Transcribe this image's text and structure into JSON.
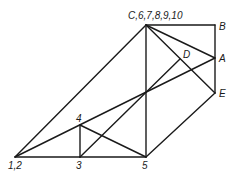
{
  "diagram": {
    "nodes": [
      {
        "id": "C",
        "label": "C,6,7,8,9,10",
        "x": 146,
        "y": 25,
        "lx": 128,
        "ly": 19
      },
      {
        "id": "B",
        "label": "B",
        "x": 215,
        "y": 25,
        "lx": 219,
        "ly": 30
      },
      {
        "id": "A",
        "label": "A",
        "x": 215,
        "y": 58,
        "lx": 219,
        "ly": 62
      },
      {
        "id": "D",
        "label": "D",
        "x": 180,
        "y": 59,
        "lx": 183,
        "ly": 58
      },
      {
        "id": "E",
        "label": "E",
        "x": 215,
        "y": 93,
        "lx": 219,
        "ly": 97
      },
      {
        "id": "X",
        "label": "",
        "x": 146,
        "y": 93,
        "lx": 0,
        "ly": 0
      },
      {
        "id": "4",
        "label": "4",
        "x": 80,
        "y": 125,
        "lx": 76,
        "ly": 122
      },
      {
        "id": "12",
        "label": "1,2",
        "x": 15,
        "y": 157,
        "lx": 8,
        "ly": 169
      },
      {
        "id": "3",
        "label": "3",
        "x": 80,
        "y": 157,
        "lx": 76,
        "ly": 169
      },
      {
        "id": "5",
        "label": "5",
        "x": 146,
        "y": 157,
        "lx": 142,
        "ly": 169
      }
    ],
    "edges": [
      [
        "C",
        "B"
      ],
      [
        "B",
        "E"
      ],
      [
        "C",
        "A"
      ],
      [
        "C",
        "E"
      ],
      [
        "C",
        "5"
      ],
      [
        "C",
        "12"
      ],
      [
        "12",
        "3"
      ],
      [
        "3",
        "5"
      ],
      [
        "5",
        "E"
      ],
      [
        "12",
        "A"
      ],
      [
        "3",
        "D"
      ],
      [
        "4",
        "3"
      ],
      [
        "4",
        "5"
      ]
    ]
  }
}
